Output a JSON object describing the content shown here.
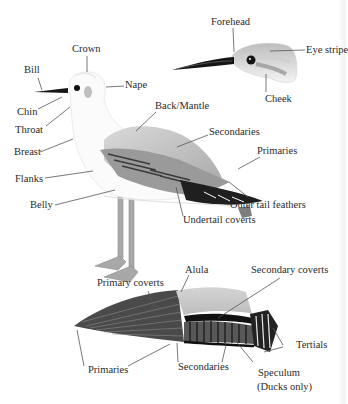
{
  "diagram": {
    "panels": [
      {
        "name": "standing-gull",
        "labels": [
          "Crown",
          "Bill",
          "Nape",
          "Chin",
          "Throat",
          "Back/Mantle",
          "Breast",
          "Secondaries",
          "Primaries",
          "Flanks",
          "Belly",
          "Outer tail feathers",
          "Undertail coverts"
        ]
      },
      {
        "name": "head-detail",
        "labels": [
          "Forehead",
          "Eye stripe",
          "Cheek"
        ]
      },
      {
        "name": "spread-wing",
        "labels": [
          "Alula",
          "Primary coverts",
          "Secondary coverts",
          "Tertials",
          "Primaries",
          "Secondaries",
          "Speculum",
          "(Ducks only)"
        ]
      }
    ]
  },
  "labels": {
    "crown": "Crown",
    "bill": "Bill",
    "nape": "Nape",
    "chin": "Chin",
    "throat": "Throat",
    "back_mantle": "Back/Mantle",
    "breast": "Breast",
    "secondaries": "Secondaries",
    "primaries": "Primaries",
    "flanks": "Flanks",
    "belly": "Belly",
    "outer_tail": "Outer tail feathers",
    "undertail": "Undertail coverts",
    "forehead": "Forehead",
    "eye_stripe": "Eye stripe",
    "cheek": "Cheek",
    "alula": "Alula",
    "primary_coverts": "Primary coverts",
    "secondary_coverts": "Secondary coverts",
    "tertials": "Tertials",
    "wing_primaries": "Primaries",
    "wing_secondaries": "Secondaries",
    "speculum": "Speculum",
    "ducks_only": "(Ducks only)"
  },
  "colors": {
    "background": "#ffffff",
    "mantle_gray": "#b9b9b9",
    "dark_feather": "#2e2e2e",
    "leg": "#a3a3a3",
    "leader_line": "#555555"
  }
}
